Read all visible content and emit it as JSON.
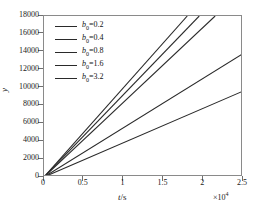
{
  "chart_data": {
    "type": "line",
    "title": "",
    "xlabel": "t/s",
    "ylabel": "y",
    "x_multiplier": "×10⁴",
    "xlim": [
      0,
      2.5
    ],
    "ylim": [
      0,
      18000
    ],
    "xticks": [
      "0",
      "0.5",
      "1",
      "1.5",
      "2",
      "2.5"
    ],
    "xtick_values": [
      0,
      0.5,
      1,
      1.5,
      2,
      2.5
    ],
    "yticks": [
      "0",
      "2000",
      "4000",
      "6000",
      "8000",
      "10000",
      "12000",
      "14000",
      "16000",
      "18000"
    ],
    "ytick_values": [
      0,
      2000,
      4000,
      6000,
      8000,
      10000,
      12000,
      14000,
      16000,
      18000
    ],
    "grid": false,
    "legend_position": "upper left",
    "line_color": "#2a2a2a",
    "frame_color": "#8a8a8a",
    "series": [
      {
        "name": "b₀=0.2",
        "slope_per_1e4": 10000,
        "x": [
          0,
          1.8
        ],
        "y": [
          0,
          18000
        ]
      },
      {
        "name": "b₀=0.4",
        "slope_per_1e4": 9230,
        "x": [
          0,
          1.95
        ],
        "y": [
          0,
          18000
        ]
      },
      {
        "name": "b₀=0.8",
        "slope_per_1e4": 8370,
        "x": [
          0,
          2.15
        ],
        "y": [
          0,
          18000
        ]
      },
      {
        "name": "b₀=1.6",
        "slope_per_1e4": 5520,
        "x": [
          0,
          2.5
        ],
        "y": [
          0,
          13800
        ]
      },
      {
        "name": "b₀=3.2",
        "slope_per_1e4": 3840,
        "x": [
          0,
          2.5
        ],
        "y": [
          0,
          9600
        ]
      }
    ]
  },
  "legend": {
    "entries": [
      {
        "symbol": "b",
        "subscript": "0",
        "value": "=0.2"
      },
      {
        "symbol": "b",
        "subscript": "0",
        "value": "=0.4"
      },
      {
        "symbol": "b",
        "subscript": "0",
        "value": "=0.8"
      },
      {
        "symbol": "b",
        "subscript": "0",
        "value": "=1.6"
      },
      {
        "symbol": "b",
        "subscript": "0",
        "value": "=3.2"
      }
    ]
  },
  "axes": {
    "x_title_italic": "t",
    "x_title_rest": "/s",
    "y_title": "y",
    "multiplier_base": "×10",
    "multiplier_exp": "4"
  }
}
